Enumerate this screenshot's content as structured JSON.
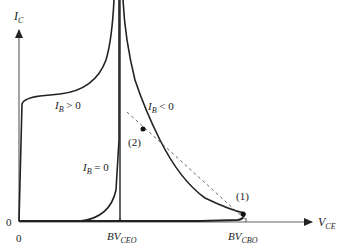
{
  "diagram": {
    "y_axis": {
      "label": "I",
      "sub": "C"
    },
    "x_axis": {
      "label": "V",
      "sub": "CE"
    },
    "origin": {
      "x_label": "0",
      "y_label": "0"
    },
    "ticks": {
      "bvceo": {
        "label": "BV",
        "sub": "CEO"
      },
      "bvcbo": {
        "label": "BV",
        "sub": "CBO"
      }
    },
    "curves": {
      "ib_pos": {
        "label": "I",
        "sub": "B",
        "relation": " > 0"
      },
      "ib_zero": {
        "label": "I",
        "sub": "B",
        "relation": " = 0"
      },
      "ib_neg": {
        "label": "I",
        "sub": "B",
        "relation": " < 0"
      }
    },
    "points": {
      "p1": "(1)",
      "p2": "(2)"
    }
  }
}
